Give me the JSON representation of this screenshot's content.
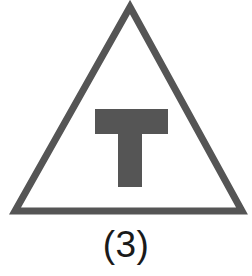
{
  "figure": {
    "caption": "(3)",
    "canvas": {
      "width": 252,
      "height": 276,
      "background_color": "#ffffff"
    },
    "symbol": {
      "name": "triangle-with-letter-t",
      "description": "Outlined triangle enclosing a solid capital letter T",
      "stroke_color": "#555555",
      "fill_color": "none",
      "stroke_width": 7,
      "letter": "T",
      "letter_color": "#555555",
      "caption_color": "#1a1a1a"
    },
    "geometry": {
      "triangle_apex_x": 130,
      "triangle_apex_y": 7,
      "triangle_left_x": 15,
      "triangle_right_x": 242,
      "triangle_base_y": 211,
      "t_crossbar_left": 95,
      "t_crossbar_right": 168,
      "t_crossbar_top": 109,
      "t_crossbar_bottom": 134,
      "t_stem_left": 118,
      "t_stem_right": 142,
      "t_stem_bottom": 187
    }
  }
}
